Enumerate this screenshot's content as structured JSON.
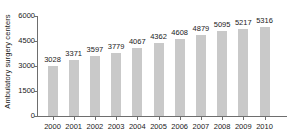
{
  "chart_data": {
    "type": "bar",
    "title": "",
    "xlabel": "",
    "ylabel": "Ambulatory surgery centers",
    "categories": [
      "2000",
      "2001",
      "2002",
      "2003",
      "2004",
      "2005",
      "2006",
      "2007",
      "2008",
      "2009",
      "2010"
    ],
    "values": [
      3028,
      3371,
      3597,
      3779,
      4067,
      4362,
      4608,
      4879,
      5095,
      5217,
      5316
    ],
    "value_labels": [
      "3028",
      "3371",
      "3597",
      "3779",
      "4067",
      "4362",
      "4608",
      "4879",
      "5095",
      "5217",
      "5316"
    ],
    "ylim": [
      0,
      6000
    ],
    "yticks": [
      0,
      1500,
      3000,
      4500,
      6000
    ],
    "ytick_labels": [
      "0",
      "1500",
      "3000",
      "4500",
      "6000"
    ],
    "grid": false,
    "legend": false,
    "bar_color": "#c9c9c9",
    "axis_color": "#6e6e6e",
    "text_color": "#1a1a1a",
    "background": "#ffffff"
  }
}
